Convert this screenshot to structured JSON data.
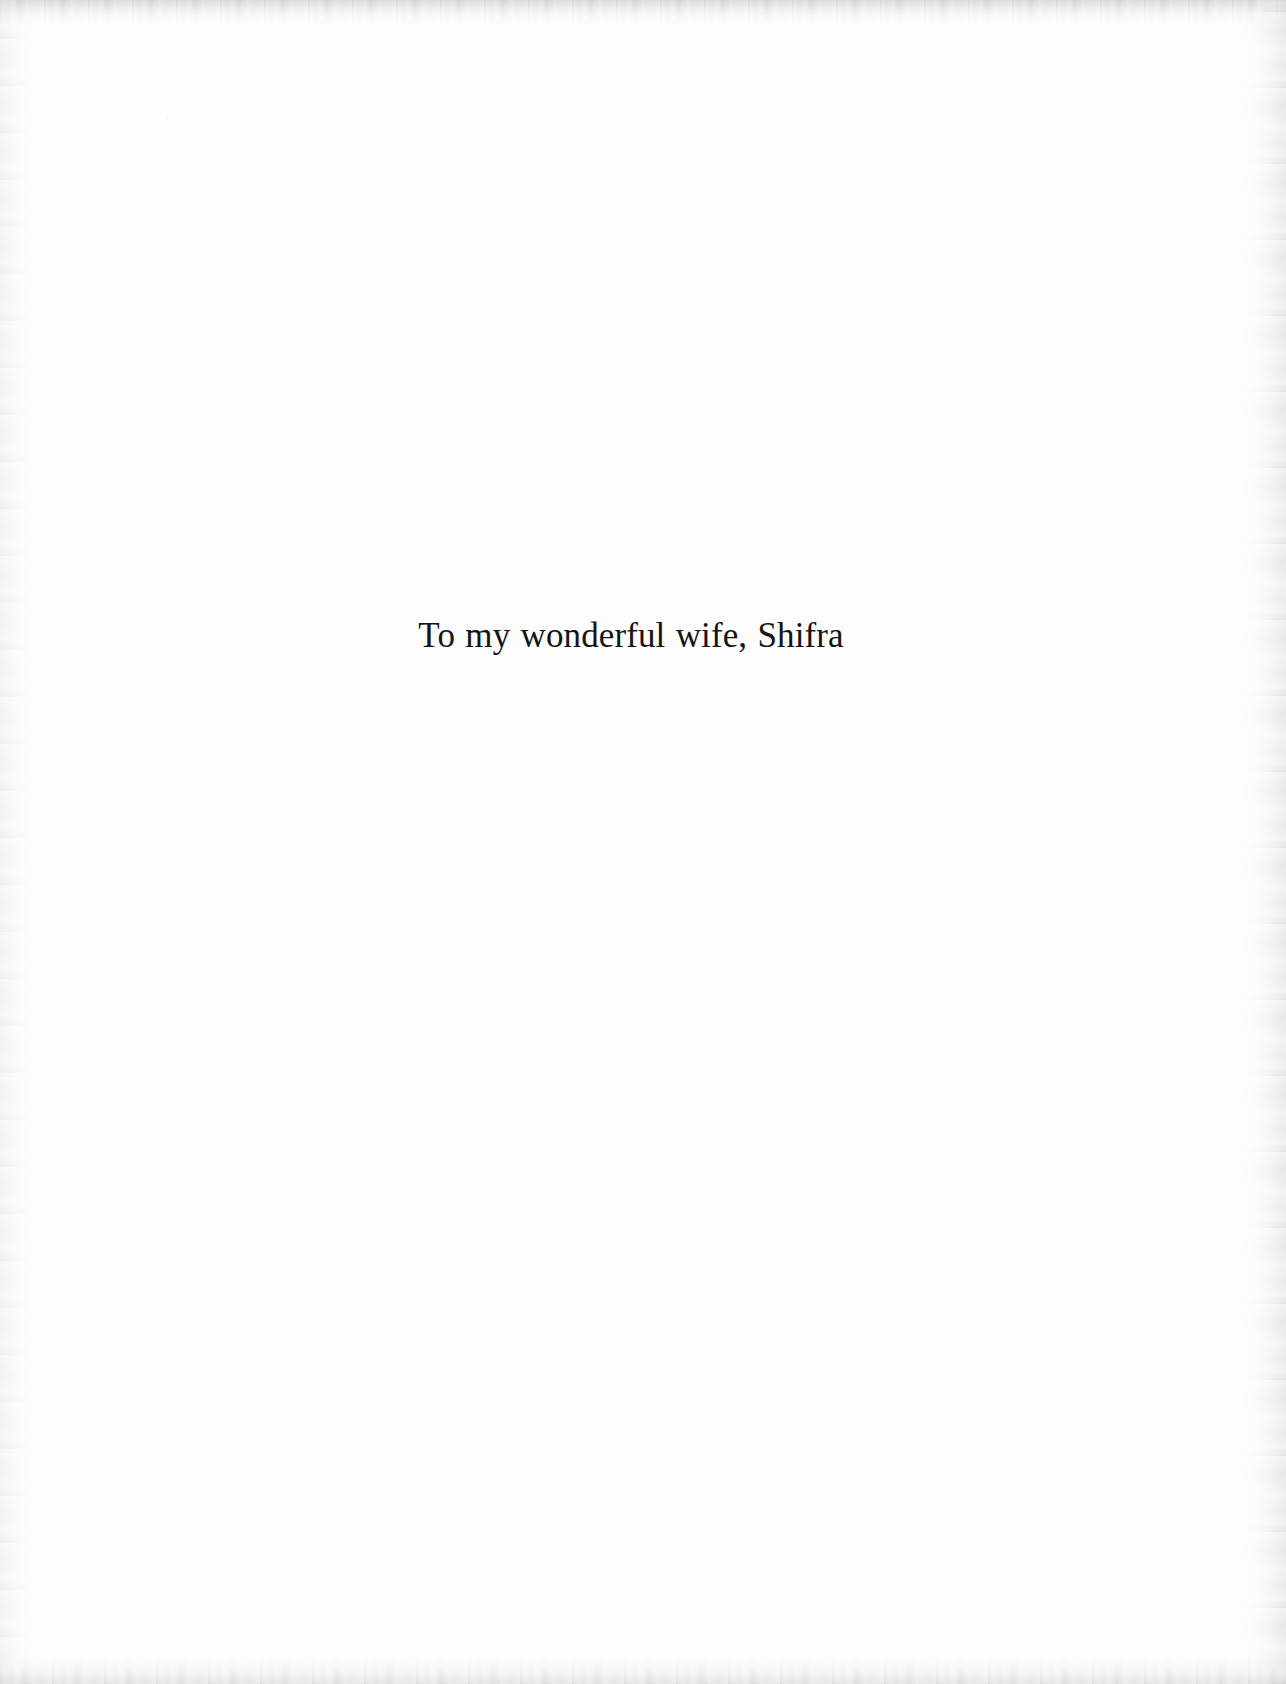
{
  "page": {
    "kind": "book-dedication-page",
    "background_color": "#fdfdfd",
    "width_px": 1286,
    "height_px": 1684
  },
  "dedication": {
    "text": "To my wonderful wife, Shifra",
    "text_color": "#141414",
    "alignment": "center"
  },
  "scan_artifacts": {
    "top_edge": {
      "name": "top-edge-scan-band",
      "color": "#c6c8cb"
    },
    "bottom_edge": {
      "name": "bottom-edge-scan-band",
      "color": "#cdcfd2"
    },
    "right_edge": {
      "name": "right-edge-scan-streak",
      "color": "#d6d8db"
    },
    "left_edge": {
      "name": "left-edge-scan-streak",
      "color": "#e0e2e4"
    }
  }
}
